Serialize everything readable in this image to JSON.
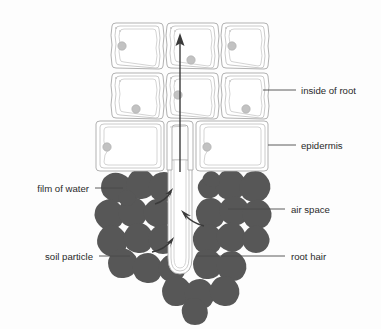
{
  "diagram": {
    "background_color": "#fdfdfd",
    "soil_color": "#575757",
    "cell_wall_color": "#a8a8a8",
    "nucleus_color": "#c2c2c2",
    "arrow_color": "#3a3a3a",
    "label_color": "#2a2a2a"
  },
  "labels": {
    "inside_of_root": "inside of root",
    "epidermis": "epidermis",
    "air_space": "air space",
    "root_hair": "root hair",
    "film_of_water": "film of water",
    "soil_particle": "soil particle"
  },
  "structures": {
    "cells_row_inner_top": 3,
    "cells_row_inner_mid": 3,
    "cells_row_epidermis": 3,
    "soil_particle_count": 29,
    "water_uptake_arrows": 3,
    "transport_arrows": 1
  }
}
